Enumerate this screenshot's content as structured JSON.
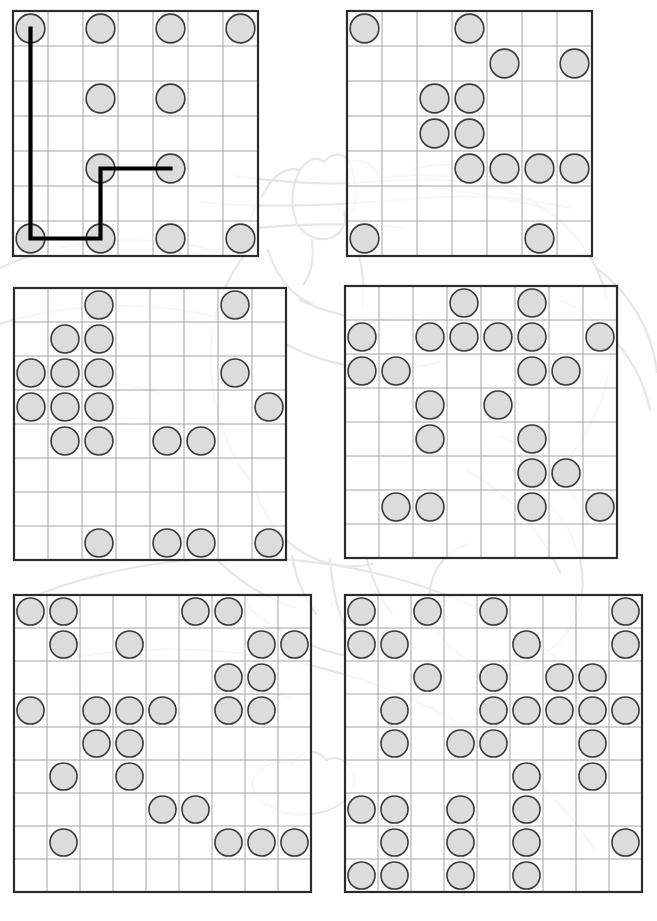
{
  "page": {
    "width": 657,
    "height": 921,
    "background": "#ffffff",
    "kind": "dot-grid-puzzle-worksheet",
    "count": 6
  },
  "style": {
    "circle_fill": "#dcdcdc",
    "circle_stroke": "#3a3a3a",
    "circle_stroke_width": 1.6,
    "grid_line": "#9a9a9a",
    "grid_border": "#2b2b2b",
    "grid_border_width": 2.2,
    "path_color": "#000000",
    "path_width": 4.2,
    "watermark_color": "#e8e6e6"
  },
  "watermark": {
    "name": "cat-line-drawing",
    "description": "faint light-gray outline drawing of a reclining cat spanning the page",
    "opacity": 0.5
  },
  "puzzles": [
    {
      "id": "puzzle-1",
      "label": "top-left",
      "x": 13,
      "y": 11,
      "cols": 7,
      "rows": 7,
      "cell": 35,
      "circles": [
        [
          0,
          0
        ],
        [
          0,
          2
        ],
        [
          0,
          4
        ],
        [
          0,
          6
        ],
        [
          2,
          2
        ],
        [
          2,
          4
        ],
        [
          4,
          2
        ],
        [
          4,
          4
        ],
        [
          6,
          0
        ],
        [
          6,
          2
        ],
        [
          6,
          4
        ],
        [
          6,
          6
        ]
      ],
      "path": {
        "present": true,
        "points": [
          [
            0,
            0
          ],
          [
            6,
            0
          ],
          [
            6,
            2
          ],
          [
            4,
            2
          ],
          [
            4,
            4
          ]
        ]
      }
    },
    {
      "id": "puzzle-2",
      "label": "top-right",
      "x": 347,
      "y": 11,
      "cols": 7,
      "rows": 7,
      "cell": 35,
      "circles": [
        [
          0,
          0
        ],
        [
          0,
          3
        ],
        [
          1,
          4
        ],
        [
          1,
          6
        ],
        [
          2,
          2
        ],
        [
          2,
          3
        ],
        [
          3,
          2
        ],
        [
          3,
          3
        ],
        [
          4,
          3
        ],
        [
          4,
          4
        ],
        [
          4,
          5
        ],
        [
          4,
          6
        ],
        [
          6,
          0
        ],
        [
          6,
          5
        ]
      ],
      "path": {
        "present": false,
        "points": []
      }
    },
    {
      "id": "puzzle-3",
      "label": "middle-left",
      "x": 14,
      "y": 288,
      "cols": 8,
      "rows": 8,
      "cell": 34,
      "circles": [
        [
          0,
          2
        ],
        [
          0,
          6
        ],
        [
          1,
          1
        ],
        [
          1,
          2
        ],
        [
          2,
          0
        ],
        [
          2,
          1
        ],
        [
          2,
          2
        ],
        [
          2,
          6
        ],
        [
          3,
          0
        ],
        [
          3,
          1
        ],
        [
          3,
          2
        ],
        [
          3,
          7
        ],
        [
          4,
          1
        ],
        [
          4,
          2
        ],
        [
          4,
          4
        ],
        [
          4,
          5
        ],
        [
          7,
          2
        ],
        [
          7,
          4
        ],
        [
          7,
          5
        ],
        [
          7,
          7
        ]
      ],
      "path": {
        "present": false,
        "points": []
      }
    },
    {
      "id": "puzzle-4",
      "label": "middle-right",
      "x": 345,
      "y": 286,
      "cols": 8,
      "rows": 8,
      "cell": 34,
      "circles": [
        [
          0,
          3
        ],
        [
          0,
          5
        ],
        [
          1,
          0
        ],
        [
          1,
          2
        ],
        [
          1,
          3
        ],
        [
          1,
          4
        ],
        [
          1,
          5
        ],
        [
          1,
          7
        ],
        [
          2,
          0
        ],
        [
          2,
          1
        ],
        [
          2,
          5
        ],
        [
          2,
          6
        ],
        [
          3,
          2
        ],
        [
          3,
          4
        ],
        [
          4,
          2
        ],
        [
          4,
          5
        ],
        [
          5,
          5
        ],
        [
          5,
          6
        ],
        [
          6,
          1
        ],
        [
          6,
          2
        ],
        [
          6,
          5
        ],
        [
          6,
          7
        ]
      ],
      "path": {
        "present": false,
        "points": []
      }
    },
    {
      "id": "puzzle-5",
      "label": "bottom-left",
      "x": 14,
      "y": 595,
      "cols": 9,
      "rows": 9,
      "cell": 33,
      "circles": [
        [
          0,
          0
        ],
        [
          0,
          1
        ],
        [
          0,
          5
        ],
        [
          0,
          6
        ],
        [
          1,
          1
        ],
        [
          1,
          3
        ],
        [
          1,
          7
        ],
        [
          1,
          8
        ],
        [
          2,
          6
        ],
        [
          2,
          7
        ],
        [
          3,
          0
        ],
        [
          3,
          2
        ],
        [
          3,
          3
        ],
        [
          3,
          4
        ],
        [
          3,
          6
        ],
        [
          3,
          7
        ],
        [
          4,
          2
        ],
        [
          4,
          3
        ],
        [
          5,
          1
        ],
        [
          5,
          3
        ],
        [
          6,
          4
        ],
        [
          6,
          5
        ],
        [
          7,
          1
        ],
        [
          7,
          6
        ],
        [
          7,
          7
        ],
        [
          7,
          8
        ]
      ],
      "path": {
        "present": false,
        "points": []
      }
    },
    {
      "id": "puzzle-6",
      "label": "bottom-right",
      "x": 345,
      "y": 595,
      "cols": 9,
      "rows": 9,
      "cell": 33,
      "circles": [
        [
          0,
          0
        ],
        [
          0,
          2
        ],
        [
          0,
          4
        ],
        [
          0,
          8
        ],
        [
          1,
          0
        ],
        [
          1,
          1
        ],
        [
          1,
          5
        ],
        [
          1,
          8
        ],
        [
          2,
          2
        ],
        [
          2,
          4
        ],
        [
          2,
          6
        ],
        [
          2,
          7
        ],
        [
          3,
          1
        ],
        [
          3,
          4
        ],
        [
          3,
          5
        ],
        [
          3,
          6
        ],
        [
          3,
          7
        ],
        [
          3,
          8
        ],
        [
          4,
          1
        ],
        [
          4,
          3
        ],
        [
          4,
          4
        ],
        [
          4,
          7
        ],
        [
          5,
          5
        ],
        [
          5,
          7
        ],
        [
          6,
          0
        ],
        [
          6,
          1
        ],
        [
          6,
          3
        ],
        [
          6,
          5
        ],
        [
          7,
          1
        ],
        [
          7,
          3
        ],
        [
          7,
          5
        ],
        [
          7,
          8
        ],
        [
          8,
          0
        ],
        [
          8,
          1
        ],
        [
          8,
          3
        ],
        [
          8,
          5
        ]
      ],
      "path": {
        "present": false,
        "points": []
      }
    }
  ]
}
